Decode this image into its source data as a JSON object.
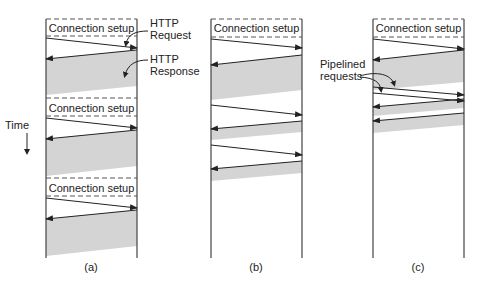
{
  "diagram": {
    "colors": {
      "line": "#333333",
      "shade": "#d4d4d4",
      "dash": "#555555"
    },
    "time_label": "Time",
    "conn_setup_label": "Connection setup",
    "annotations": {
      "http_request": [
        "HTTP",
        "Request"
      ],
      "http_response": [
        "HTTP",
        "Response"
      ],
      "pipelined": [
        "Pipelined",
        "requests"
      ]
    },
    "panels": [
      {
        "id": "a",
        "caption": "(a)",
        "description": "Multiple connections and sequential requests"
      },
      {
        "id": "b",
        "caption": "(b)",
        "description": "A persistent connection and sequential requests"
      },
      {
        "id": "c",
        "caption": "(c)",
        "description": "A persistent connection and pipelined requests"
      }
    ]
  }
}
